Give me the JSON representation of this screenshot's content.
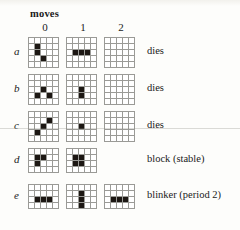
{
  "figure": {
    "header": "moves",
    "column_headers": [
      "0",
      "1",
      "2"
    ],
    "notes_column_x_label": "outcome"
  },
  "rows": [
    {
      "label": "a",
      "note": "dies",
      "grid_cols": 5,
      "grid_rows": 5,
      "cell_px": 6,
      "top": 37,
      "states": [
        {
          "move": "0",
          "live": [
            [
              1,
              1
            ],
            [
              2,
              1
            ],
            [
              3,
              2
            ]
          ]
        },
        {
          "move": "1",
          "live": [
            [
              2,
              1
            ],
            [
              2,
              2
            ],
            [
              2,
              3
            ]
          ]
        },
        {
          "move": "2",
          "live": []
        }
      ]
    },
    {
      "label": "b",
      "note": "dies",
      "grid_cols": 5,
      "grid_rows": 5,
      "cell_px": 6,
      "top": 74,
      "states": [
        {
          "move": "0",
          "live": [
            [
              2,
              2
            ],
            [
              3,
              1
            ],
            [
              3,
              3
            ]
          ]
        },
        {
          "move": "1",
          "live": [
            [
              2,
              2
            ],
            [
              3,
              2
            ]
          ]
        },
        {
          "move": "2",
          "live": []
        }
      ]
    },
    {
      "label": "c",
      "note": "dies",
      "grid_cols": 5,
      "grid_rows": 5,
      "cell_px": 6,
      "top": 111,
      "states": [
        {
          "move": "0",
          "live": [
            [
              1,
              3
            ],
            [
              2,
              2
            ],
            [
              3,
              1
            ]
          ]
        },
        {
          "move": "1",
          "live": [
            [
              2,
              2
            ]
          ]
        },
        {
          "move": "2",
          "live": []
        }
      ]
    },
    {
      "label": "d",
      "note": "block (stable)",
      "grid_cols": 5,
      "grid_rows": 4,
      "cell_px": 6,
      "top": 148,
      "states": [
        {
          "move": "0",
          "live": [
            [
              1,
              1
            ],
            [
              1,
              2
            ],
            [
              2,
              1
            ]
          ]
        },
        {
          "move": "1",
          "live": [
            [
              1,
              1
            ],
            [
              1,
              2
            ],
            [
              2,
              1
            ],
            [
              2,
              2
            ]
          ]
        }
      ]
    },
    {
      "label": "e",
      "note": "blinker (period 2)",
      "grid_cols": 5,
      "grid_rows": 4,
      "cell_px": 6,
      "top": 184,
      "states": [
        {
          "move": "0",
          "live": [
            [
              2,
              1
            ],
            [
              2,
              2
            ],
            [
              2,
              3
            ]
          ]
        },
        {
          "move": "1",
          "live": [
            [
              1,
              2
            ],
            [
              2,
              2
            ],
            [
              3,
              2
            ]
          ]
        },
        {
          "move": "2",
          "live": [
            [
              2,
              1
            ],
            [
              2,
              2
            ],
            [
              2,
              3
            ]
          ]
        }
      ]
    }
  ],
  "colors": {
    "live_cell": "#1c1713",
    "grid_line": "#9a9a96",
    "page_background": "#fdfdfb",
    "text": "#1a1a1a"
  }
}
